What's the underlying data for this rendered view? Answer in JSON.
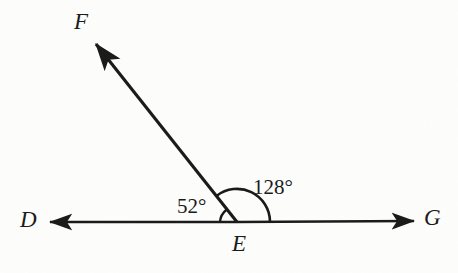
{
  "figure": {
    "type": "angle-diagram",
    "background_color": "#fdfdfc",
    "stroke_color": "#1a1a1a",
    "points": {
      "D": {
        "label": "D",
        "x": 32,
        "y": 221
      },
      "E": {
        "label": "E",
        "x": 237,
        "y": 222
      },
      "G": {
        "label": "G",
        "x": 433,
        "y": 220
      },
      "F": {
        "label": "F",
        "x": 85,
        "y": 22
      }
    },
    "rays": [
      {
        "name": "ray-ED",
        "from": "E",
        "to": "D",
        "arrow_tip": {
          "x": 48,
          "y": 222
        }
      },
      {
        "name": "ray-EG",
        "from": "E",
        "to": "G",
        "arrow_tip": {
          "x": 416,
          "y": 221
        }
      },
      {
        "name": "ray-EF",
        "from": "E",
        "to": "F",
        "arrow_tip": {
          "x": 93,
          "y": 41
        }
      }
    ],
    "angles": [
      {
        "name": "angle-DEF",
        "value": 52,
        "label": "52°",
        "arc_radius": 17,
        "between": [
          "ray-EF",
          "ray-ED"
        ]
      },
      {
        "name": "angle-FEG",
        "value": 128,
        "label": "128°",
        "arc_radius": 33,
        "between": [
          "ray-EG",
          "ray-EF"
        ]
      }
    ]
  }
}
